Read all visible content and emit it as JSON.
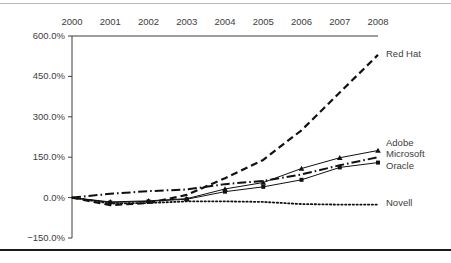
{
  "figure": {
    "background": "#ffffff",
    "axis_color": "#3d3d3d",
    "top_rule_color": "#b9b9b9",
    "bottom_rule_color": "#1a1a1a"
  },
  "chart_data": {
    "type": "line",
    "title": "",
    "xlabel": "",
    "ylabel": "",
    "grid": false,
    "legend_position": "right-inline-end-of-line",
    "x_axis_position": "top",
    "categories": [
      "2000",
      "2001",
      "2002",
      "2003",
      "2004",
      "2005",
      "2006",
      "2007",
      "2008"
    ],
    "x": [
      2000,
      2001,
      2002,
      2003,
      2004,
      2005,
      2006,
      2007,
      2008
    ],
    "xlim": [
      2000,
      2008
    ],
    "ylim": [
      -150,
      600
    ],
    "ytick_labels": [
      "600.0%",
      "450.0%",
      "300.0%",
      "150.0%",
      "0.0%",
      "-150.0%"
    ],
    "yticks": [
      600,
      450,
      300,
      150,
      0,
      -150
    ],
    "unit": "%",
    "series": [
      {
        "name": "Red Hat",
        "line_style": "dashed",
        "marker": "none",
        "color": "#111111",
        "width": 2.2,
        "values": [
          0,
          -28,
          -20,
          10,
          72,
          140,
          250,
          390,
          530
        ]
      },
      {
        "name": "Adobe",
        "line_style": "solid",
        "marker": "triangle",
        "color": "#111111",
        "width": 1.0,
        "values": [
          0,
          -16,
          -12,
          -4,
          32,
          56,
          108,
          148,
          175
        ]
      },
      {
        "name": "Microsoft",
        "line_style": "dash-dot",
        "marker": "none",
        "color": "#111111",
        "width": 2.0,
        "values": [
          0,
          14,
          24,
          30,
          50,
          62,
          86,
          120,
          150
        ]
      },
      {
        "name": "Oracle",
        "line_style": "solid",
        "marker": "square",
        "color": "#111111",
        "width": 1.0,
        "values": [
          0,
          -18,
          -14,
          -6,
          22,
          40,
          66,
          112,
          130
        ]
      },
      {
        "name": "Novell",
        "line_style": "dotted",
        "marker": "none",
        "color": "#111111",
        "width": 1.8,
        "values": [
          0,
          -22,
          -20,
          -14,
          -14,
          -16,
          -24,
          -26,
          -26
        ]
      }
    ],
    "series_label_y_px": {
      "Red Hat": 54,
      "Adobe": 143,
      "Microsoft": 154,
      "Oracle": 166,
      "Novell": 203
    }
  }
}
